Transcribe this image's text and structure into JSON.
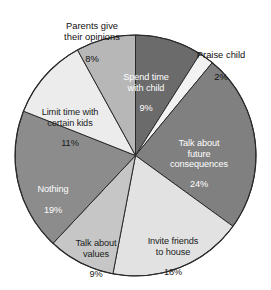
{
  "chart_data": {
    "type": "pie",
    "title": "",
    "subtitle": "",
    "xlabel": "",
    "ylabel": "",
    "legend_position": "none",
    "grid": false,
    "units": "percent",
    "start_angle_deg": 0,
    "direction": "clockwise",
    "categories": [
      "Spend time with child",
      "Praise child",
      "Talk about future consequences",
      "Invite friends to house",
      "Talk about values",
      "Nothing",
      "Limit time with certain kids",
      "Parents give their opinions"
    ],
    "values": [
      9,
      2,
      24,
      18,
      9,
      19,
      11,
      8
    ],
    "colors": [
      "#6b6b6b",
      "#f2f2f2",
      "#808080",
      "#e2e2e2",
      "#c6c6c6",
      "#8c8c8c",
      "#ececec",
      "#b7b7b7"
    ],
    "slices": [
      {
        "name": "Spend time with child",
        "label_lines": "Spend time\nwith child",
        "value": 9,
        "value_label": "9%",
        "color": "#6b6b6b",
        "text_color": "#ffffff",
        "label_placement": "inside"
      },
      {
        "name": "Praise child",
        "label_lines": "Praise child",
        "value": 2,
        "value_label": "2%",
        "color": "#f2f2f2",
        "text_color": "#111111",
        "label_placement": "outside"
      },
      {
        "name": "Talk about future consequences",
        "label_lines": "Talk about\nfuture\nconsequences",
        "value": 24,
        "value_label": "24%",
        "color": "#808080",
        "text_color": "#ffffff",
        "label_placement": "inside"
      },
      {
        "name": "Invite friends to house",
        "label_lines": "Invite friends\nto house",
        "value": 18,
        "value_label": "18%",
        "color": "#e2e2e2",
        "text_color": "#1b1b1b",
        "label_placement": "inside"
      },
      {
        "name": "Talk about values",
        "label_lines": "Talk about\nvalues",
        "value": 9,
        "value_label": "9%",
        "color": "#c6c6c6",
        "text_color": "#1b1b1b",
        "label_placement": "inside"
      },
      {
        "name": "Nothing",
        "label_lines": "Nothing",
        "value": 19,
        "value_label": "19%",
        "color": "#8c8c8c",
        "text_color": "#ffffff",
        "label_placement": "inside"
      },
      {
        "name": "Limit time with certain kids",
        "label_lines": "Limit time with\ncertain kids",
        "value": 11,
        "value_label": "11%",
        "color": "#ececec",
        "text_color": "#1b1b1b",
        "label_placement": "inside"
      },
      {
        "name": "Parents give their opinions",
        "label_lines": "Parents give\ntheir opinions",
        "value": 8,
        "value_label": "8%",
        "color": "#b7b7b7",
        "text_color": "#111111",
        "label_placement": "outside"
      }
    ]
  },
  "labels": {
    "spend_time": "Spend time\nwith child",
    "spend_time_pct": "9%",
    "praise_child": "Praise child",
    "praise_child_pct": "2%",
    "future_consequences": "Talk about\nfuture\nconsequences",
    "future_consequences_pct": "24%",
    "invite_friends": "Invite friends\nto house",
    "invite_friends_pct": "18%",
    "talk_values": "Talk about\nvalues",
    "talk_values_pct": "9%",
    "nothing": "Nothing",
    "nothing_pct": "19%",
    "limit_time": "Limit time with\ncertain kids",
    "limit_time_pct": "11%",
    "parents_opinions": "Parents give\ntheir opinions",
    "parents_opinions_pct": "8%"
  }
}
